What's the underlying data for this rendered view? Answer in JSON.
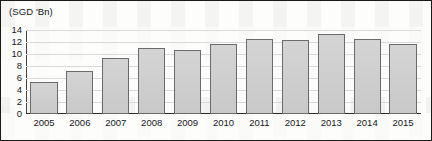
{
  "axis_title": "(SGD 'Bn)",
  "chart_data": {
    "type": "bar",
    "title": "",
    "subtitle": "",
    "xlabel": "",
    "ylabel": "(SGD 'Bn)",
    "categories": [
      "2005",
      "2006",
      "2007",
      "2008",
      "2009",
      "2010",
      "2011",
      "2012",
      "2013",
      "2014",
      "2015"
    ],
    "values": [
      5.3,
      7.1,
      9.2,
      10.9,
      10.6,
      11.6,
      12.4,
      12.3,
      13.3,
      12.4,
      11.6
    ],
    "series": [
      {
        "name": "(SGD 'Bn)",
        "values": [
          5.3,
          7.1,
          9.2,
          10.9,
          10.6,
          11.6,
          12.4,
          12.3,
          13.3,
          12.4,
          11.6
        ]
      }
    ],
    "ylim": [
      0,
      14
    ],
    "yticks": [
      0,
      2,
      4,
      6,
      8,
      10,
      12,
      14
    ],
    "ytick_labels": [
      "0",
      "2",
      "4",
      "6",
      "8",
      "10",
      "12",
      "14"
    ],
    "grid": "horizontal",
    "legend": "none",
    "bar_fill_color": "#cfcfcf",
    "bar_border_color": "#6b6b6b",
    "gridline_color": "#d9d9d9",
    "axis_color": "#2a2a2a",
    "frame_color": "#1a1a1a",
    "text_color": "#16181a"
  }
}
